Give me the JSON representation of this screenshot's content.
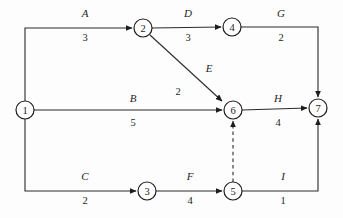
{
  "diagram": {
    "type": "directed-graph",
    "colors": {
      "stroke": "#2b2b2b",
      "node_stroke": "#1d1d1d",
      "node_fill": "#ffffff",
      "background": "#fdfdfd",
      "text": "#1d1d1d"
    },
    "nodes": [
      {
        "id": "1",
        "label": "1",
        "cx": 25,
        "cy": 110,
        "r": 9
      },
      {
        "id": "2",
        "label": "2",
        "cx": 143,
        "cy": 28,
        "r": 9
      },
      {
        "id": "3",
        "label": "3",
        "cx": 147,
        "cy": 191,
        "r": 9
      },
      {
        "id": "4",
        "label": "4",
        "cx": 232,
        "cy": 27,
        "r": 9
      },
      {
        "id": "5",
        "label": "5",
        "cx": 233,
        "cy": 191,
        "r": 9
      },
      {
        "id": "6",
        "label": "6",
        "cx": 233,
        "cy": 110,
        "r": 9
      },
      {
        "id": "7",
        "label": "7",
        "cx": 318,
        "cy": 108,
        "r": 9
      }
    ],
    "edges": [
      {
        "id": "A",
        "name": "A",
        "weight": "3",
        "from": "1",
        "to": "2",
        "style": "solid",
        "name_x": 85,
        "name_y": 17,
        "weight_x": 85,
        "weight_y": 41
      },
      {
        "id": "D",
        "name": "D",
        "weight": "3",
        "from": "2",
        "to": "4",
        "style": "solid",
        "name_x": 188,
        "name_y": 17,
        "weight_x": 188,
        "weight_y": 41
      },
      {
        "id": "G",
        "name": "G",
        "weight": "2",
        "from": "4",
        "to": "7",
        "style": "solid",
        "name_x": 281,
        "name_y": 17,
        "weight_x": 281,
        "weight_y": 41
      },
      {
        "id": "E",
        "name": "E",
        "weight": "2",
        "from": "2",
        "to": "6",
        "style": "solid",
        "name_x": 209,
        "name_y": 72,
        "weight_x": 178,
        "weight_y": 95
      },
      {
        "id": "B",
        "name": "B",
        "weight": "5",
        "from": "1",
        "to": "6",
        "style": "solid",
        "name_x": 133,
        "name_y": 102,
        "weight_x": 133,
        "weight_y": 126
      },
      {
        "id": "H",
        "name": "H",
        "weight": "4",
        "from": "6",
        "to": "7",
        "style": "solid",
        "name_x": 278,
        "name_y": 102,
        "weight_x": 278,
        "weight_y": 126
      },
      {
        "id": "C",
        "name": "C",
        "weight": "2",
        "from": "1",
        "to": "3",
        "style": "solid",
        "name_x": 85,
        "name_y": 180,
        "weight_x": 85,
        "weight_y": 204
      },
      {
        "id": "F",
        "name": "F",
        "weight": "4",
        "from": "3",
        "to": "5",
        "style": "solid",
        "name_x": 190,
        "name_y": 180,
        "weight_x": 190,
        "weight_y": 204
      },
      {
        "id": "I",
        "name": "I",
        "weight": "1",
        "from": "5",
        "to": "7",
        "style": "solid",
        "name_x": 283,
        "name_y": 180,
        "weight_x": 283,
        "weight_y": 204
      },
      {
        "id": "dummy",
        "name": "",
        "weight": "",
        "from": "5",
        "to": "6",
        "style": "dashed",
        "name_x": 0,
        "name_y": 0,
        "weight_x": 0,
        "weight_y": 0
      }
    ]
  }
}
